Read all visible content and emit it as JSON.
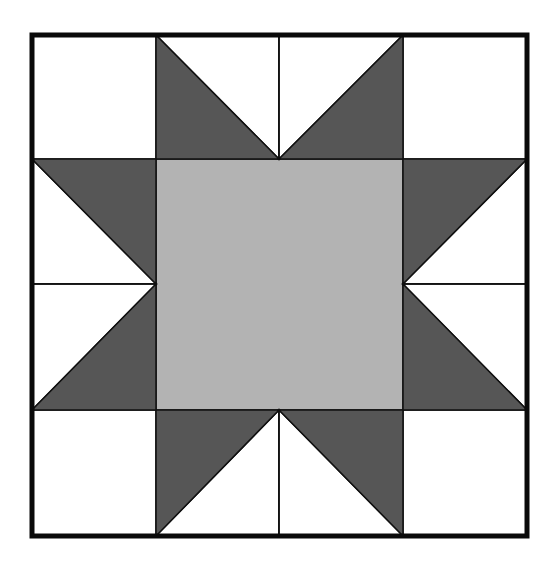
{
  "diagram": {
    "grid": {
      "rows": 4,
      "cols": 4,
      "x": [
        32,
        156,
        279,
        403,
        527
      ],
      "y": [
        35,
        159,
        284,
        410,
        536
      ]
    },
    "colors": {
      "background": "#ffffff",
      "light": "#ffffff",
      "dark": "#565656",
      "center": "#b3b3b3",
      "line": "#111111",
      "border": "#0a0a0a"
    },
    "border_width": 5,
    "line_width": 1.5,
    "components": {
      "corner_squares": 4,
      "center_square": 1,
      "star_point_triangles": 8,
      "background_triangles": 8
    }
  }
}
